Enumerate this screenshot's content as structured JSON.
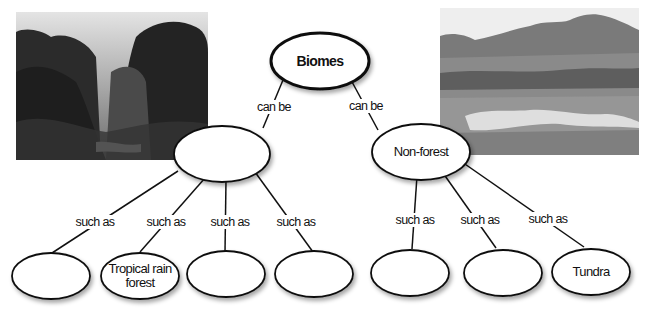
{
  "diagram": {
    "type": "concept-map",
    "root": {
      "label": "Biomes"
    },
    "branches": [
      {
        "link_label": "can be",
        "node_label": "",
        "children": [
          {
            "link_label": "such as",
            "node_label": ""
          },
          {
            "link_label": "such as",
            "node_label": "Tropical rain forest",
            "lines": [
              "Tropical rain",
              "forest"
            ]
          },
          {
            "link_label": "such as",
            "node_label": ""
          },
          {
            "link_label": "such as",
            "node_label": ""
          }
        ]
      },
      {
        "link_label": "can be",
        "node_label": "Non-forest",
        "children": [
          {
            "link_label": "such as",
            "node_label": ""
          },
          {
            "link_label": "such as",
            "node_label": ""
          },
          {
            "link_label": "such as",
            "node_label": "Tundra"
          }
        ]
      }
    ],
    "photos": [
      {
        "subject": "misty tropical rain forest (grayscale)"
      },
      {
        "subject": "tundra landscape with mountains and pond (grayscale)"
      }
    ]
  }
}
